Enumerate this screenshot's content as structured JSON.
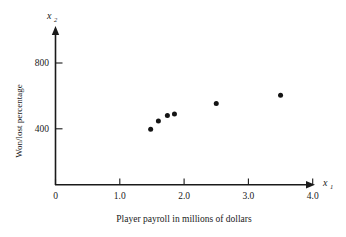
{
  "chart_data": {
    "type": "scatter",
    "title": "",
    "xlabel": "Player payroll in millions of dollars",
    "ylabel": "Won/lost percentage",
    "x_var": "x",
    "x_var_sub": "1",
    "y_var": "x",
    "y_var_sub": "2",
    "xlim": [
      0,
      4.3
    ],
    "ylim": [
      0,
      920
    ],
    "grid": false,
    "legend": "none",
    "x_ticks": [
      {
        "value": 0,
        "label": "0"
      },
      {
        "value": 1.0,
        "label": "1.0"
      },
      {
        "value": 2.0,
        "label": "2.0"
      },
      {
        "value": 3.0,
        "label": "3.0"
      },
      {
        "value": 4.0,
        "label": "4.0"
      }
    ],
    "y_ticks": [
      {
        "value": 400,
        "label": "400"
      },
      {
        "value": 800,
        "label": "800"
      }
    ],
    "points": [
      {
        "x": 1.48,
        "y": 396
      },
      {
        "x": 1.6,
        "y": 455
      },
      {
        "x": 1.74,
        "y": 495
      },
      {
        "x": 1.85,
        "y": 505
      },
      {
        "x": 2.5,
        "y": 580
      },
      {
        "x": 3.5,
        "y": 640
      }
    ],
    "marker": "filled-circle",
    "marker_color": "#141414",
    "axis_color": "#1a1a1a",
    "background_color": "#ffffff"
  }
}
